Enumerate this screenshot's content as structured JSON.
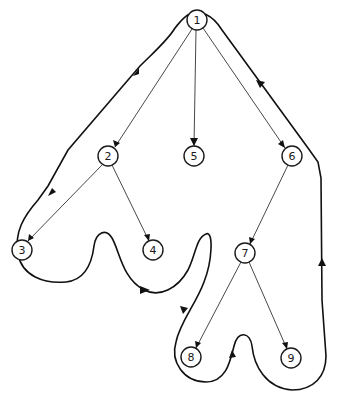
{
  "diagram": {
    "type": "tree-euler-tour",
    "nodes": [
      {
        "id": "1",
        "label": "1",
        "x": 197,
        "y": 20
      },
      {
        "id": "2",
        "label": "2",
        "x": 108,
        "y": 156
      },
      {
        "id": "3",
        "label": "3",
        "x": 22,
        "y": 250
      },
      {
        "id": "4",
        "label": "4",
        "x": 153,
        "y": 250
      },
      {
        "id": "5",
        "label": "5",
        "x": 194,
        "y": 156
      },
      {
        "id": "6",
        "label": "6",
        "x": 292,
        "y": 156
      },
      {
        "id": "7",
        "label": "7",
        "x": 245,
        "y": 253
      },
      {
        "id": "8",
        "label": "8",
        "x": 191,
        "y": 357
      },
      {
        "id": "9",
        "label": "9",
        "x": 291,
        "y": 358
      }
    ],
    "edges": [
      {
        "from": "1",
        "to": "2"
      },
      {
        "from": "1",
        "to": "5"
      },
      {
        "from": "1",
        "to": "6"
      },
      {
        "from": "2",
        "to": "3"
      },
      {
        "from": "2",
        "to": "4"
      },
      {
        "from": "6",
        "to": "7"
      },
      {
        "from": "7",
        "to": "8"
      },
      {
        "from": "7",
        "to": "9"
      }
    ],
    "contour_direction": "counter-clockwise traversal around tree",
    "colors": {
      "stroke": "#111111",
      "background": "#ffffff"
    }
  }
}
